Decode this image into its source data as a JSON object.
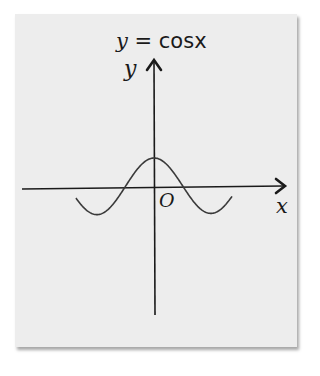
{
  "figure": {
    "title_var": "y",
    "title_eq": " = ",
    "title_fn": "cosx",
    "title_full": "y = cosx",
    "y_axis_label": "y",
    "x_axis_label": "x",
    "origin_label": "O",
    "colors": {
      "background": "#ededed",
      "ink": "#1a1a1a",
      "curve": "#3a3a3a"
    }
  },
  "chart_data": {
    "type": "line",
    "title": "y = cosx",
    "xlabel": "x",
    "ylabel": "y",
    "function": "cos(x)",
    "origin_label": "O",
    "x_range_approx": [
      -4.3,
      4.3
    ],
    "y_range_approx": [
      -1,
      1
    ],
    "grid": false,
    "legend": null,
    "tick_labels": [],
    "key_points": [
      {
        "x": 0,
        "y": 1,
        "note": "maximum at y-axis"
      },
      {
        "x": -1.5708,
        "y": 0,
        "note": "zero crossing"
      },
      {
        "x": 1.5708,
        "y": 0,
        "note": "zero crossing"
      },
      {
        "x": -3.1416,
        "y": -1,
        "note": "minimum"
      },
      {
        "x": 3.1416,
        "y": -1,
        "note": "minimum"
      },
      {
        "x": -4.7124,
        "y": 0,
        "note": "zero crossing"
      },
      {
        "x": 4.7124,
        "y": 0,
        "note": "zero crossing"
      }
    ]
  }
}
